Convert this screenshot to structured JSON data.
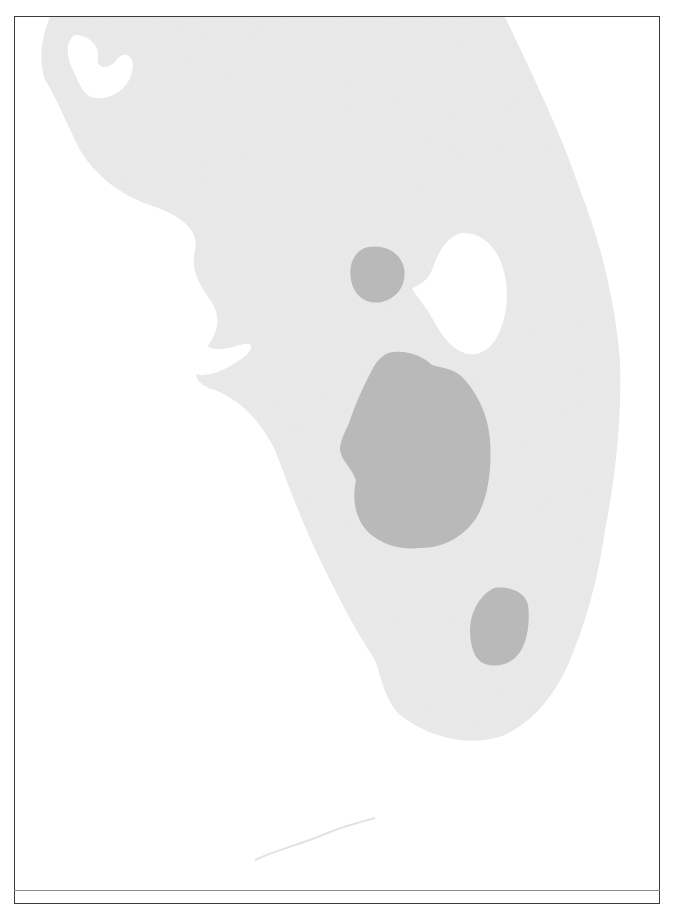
{
  "map": {
    "region": "South Florida peninsula",
    "style": "grayscale scanned map",
    "colors": {
      "background": "#ffffff",
      "land": "#ebebeb",
      "water_lake": "#ffffff",
      "highlight_region": "#b9b9b9",
      "frame": "#3a3a3a",
      "rule": "#8a8a8a"
    },
    "features": [
      {
        "id": "lake",
        "label": "",
        "type": "lake"
      },
      {
        "id": "region-north",
        "label": "",
        "type": "highlighted-area"
      },
      {
        "id": "region-central",
        "label": "",
        "type": "highlighted-area"
      },
      {
        "id": "region-south",
        "label": "",
        "type": "highlighted-area"
      }
    ]
  }
}
